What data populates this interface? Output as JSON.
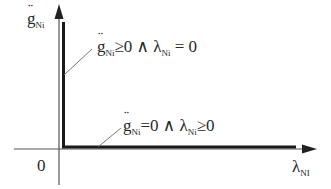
{
  "diagram": {
    "type": "complementarity-graph",
    "y_axis": {
      "symbol": "g",
      "accent": "double-dot",
      "subscript": "Ni"
    },
    "x_axis": {
      "symbol": "λ",
      "subscript": "NI"
    },
    "origin_label": "0",
    "annotations": [
      {
        "id": "vertical-branch",
        "text_parts": [
          "g",
          "Ni",
          "≥0 ∧ λ",
          "Ni",
          " = 0"
        ],
        "plain": "g̈Ni ≥ 0 ∧ λNi = 0"
      },
      {
        "id": "horizontal-branch",
        "text_parts": [
          "g",
          "Ni",
          "=0 ∧ λ",
          "Ni",
          "≥0"
        ],
        "plain": "g̈Ni = 0 ∧ λNi ≥ 0"
      }
    ],
    "colors": {
      "axis": "#555555",
      "branch": "#1a1a1a",
      "text": "#2a2a2a"
    }
  }
}
